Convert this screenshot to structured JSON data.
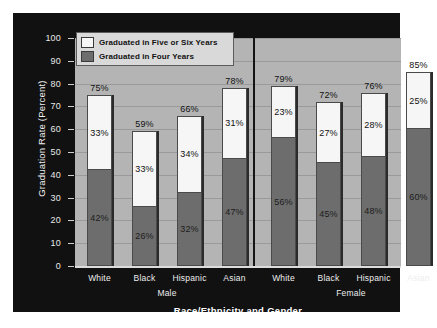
{
  "chart_data": {
    "type": "bar",
    "stacked": true,
    "title": "",
    "xlabel": "Race/Ethnicity and Gender",
    "ylabel": "Graduation Rate (Percent)",
    "ylim": [
      0,
      100
    ],
    "ytick_labels": [
      "0",
      "10",
      "20",
      "30",
      "40",
      "50",
      "60",
      "70",
      "80",
      "90",
      "100"
    ],
    "grid": true,
    "legend_position": "top-left",
    "legend": [
      {
        "label": "Graduated in Five or Six Years",
        "color": "#f6f6f6"
      },
      {
        "label": "Graduated in Four Years",
        "color": "#6d6d6d"
      }
    ],
    "groups": [
      {
        "name": "Male",
        "categories": [
          "White",
          "Black",
          "Hispanic",
          "Asian"
        ]
      },
      {
        "name": "Female",
        "categories": [
          "White",
          "Black",
          "Hispanic",
          "Asian"
        ]
      }
    ],
    "categories": [
      "White",
      "Black",
      "Hispanic",
      "Asian",
      "White",
      "Black",
      "Hispanic",
      "Asian"
    ],
    "series": [
      {
        "name": "Graduated in Four Years",
        "values": [
          42,
          26,
          32,
          47,
          56,
          45,
          48,
          60
        ]
      },
      {
        "name": "Graduated in Five or Six Years",
        "values": [
          33,
          33,
          34,
          31,
          23,
          27,
          28,
          25
        ]
      }
    ],
    "totals": [
      75,
      59,
      66,
      78,
      79,
      72,
      76,
      85
    ],
    "bars": [
      {
        "group": "Male",
        "category": "White",
        "four_year": 42,
        "five_or_six_year": 33,
        "total": 75,
        "four_year_label": "42%",
        "five_or_six_year_label": "33%",
        "total_label": "75%"
      },
      {
        "group": "Male",
        "category": "Black",
        "four_year": 26,
        "five_or_six_year": 33,
        "total": 59,
        "four_year_label": "26%",
        "five_or_six_year_label": "33%",
        "total_label": "59%"
      },
      {
        "group": "Male",
        "category": "Hispanic",
        "four_year": 32,
        "five_or_six_year": 34,
        "total": 66,
        "four_year_label": "32%",
        "five_or_six_year_label": "34%",
        "total_label": "66%"
      },
      {
        "group": "Male",
        "category": "Asian",
        "four_year": 47,
        "five_or_six_year": 31,
        "total": 78,
        "four_year_label": "47%",
        "five_or_six_year_label": "31%",
        "total_label": "78%"
      },
      {
        "group": "Female",
        "category": "White",
        "four_year": 56,
        "five_or_six_year": 23,
        "total": 79,
        "four_year_label": "56%",
        "five_or_six_year_label": "23%",
        "total_label": "79%"
      },
      {
        "group": "Female",
        "category": "Black",
        "four_year": 45,
        "five_or_six_year": 27,
        "total": 72,
        "four_year_label": "45%",
        "five_or_six_year_label": "27%",
        "total_label": "72%"
      },
      {
        "group": "Female",
        "category": "Hispanic",
        "four_year": 48,
        "five_or_six_year": 28,
        "total": 76,
        "four_year_label": "48%",
        "five_or_six_year_label": "28%",
        "total_label": "76%"
      },
      {
        "group": "Female",
        "category": "Asian",
        "four_year": 60,
        "five_or_six_year": 25,
        "total": 85,
        "four_year_label": "60%",
        "five_or_six_year_label": "25%",
        "total_label": "85%"
      }
    ],
    "colors": {
      "panel_background": "#111111",
      "plot_background": "#b4b4b4",
      "gridline": "#9a9a9a",
      "four_year_fill": "#6d6d6d",
      "five_or_six_year_fill": "#f6f6f6",
      "bar_outline": "#4a4a4a",
      "axis_text": "#ededed",
      "legend_background": "#d9d9d9"
    }
  }
}
